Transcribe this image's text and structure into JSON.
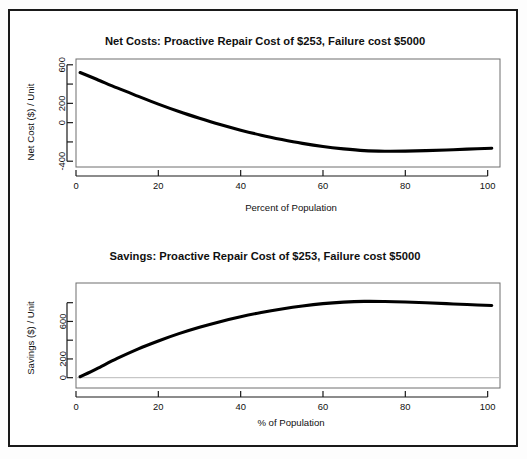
{
  "figure": {
    "background_color": "#ffffff",
    "frame_color": "#1a1a1a",
    "curve_color": "#000000",
    "box_color": "#6e6e6e"
  },
  "chart_data": [
    {
      "type": "line",
      "id": "net-costs",
      "title": "Net Costs: Proactive Repair Cost of $253, Failure cost $5000",
      "xlabel": "Percent of Population",
      "ylabel": "Net Cost ($) / Unit",
      "xlim": [
        0,
        103
      ],
      "ylim": [
        -460,
        660
      ],
      "xticks": [
        0,
        20,
        40,
        60,
        80,
        100
      ],
      "xticklabels": [
        "0",
        "20",
        "40",
        "60",
        "80",
        "100"
      ],
      "yticks": [
        -400,
        -200,
        0,
        200,
        400,
        600
      ],
      "yticklabels": [
        "-400",
        "",
        "0",
        "200",
        "",
        "600"
      ],
      "grid": false,
      "legend": "none",
      "x": [
        1,
        5,
        10,
        15,
        20,
        25,
        30,
        35,
        40,
        45,
        50,
        55,
        60,
        65,
        70,
        75,
        80,
        85,
        90,
        95,
        101
      ],
      "values": [
        520,
        450,
        360,
        275,
        192,
        115,
        45,
        -20,
        -78,
        -130,
        -175,
        -215,
        -248,
        -272,
        -290,
        -296,
        -295,
        -290,
        -283,
        -275,
        -265
      ]
    },
    {
      "type": "line",
      "id": "savings",
      "title": "Savings: Proactive Repair Cost of $253, Failure cost $5000",
      "xlabel": "% of Population",
      "ylabel": "Savings ($) / Unit",
      "xlim": [
        0,
        103
      ],
      "ylim": [
        -110,
        1010
      ],
      "xticks": [
        0,
        20,
        40,
        60,
        80,
        100
      ],
      "xticklabels": [
        "0",
        "20",
        "40",
        "60",
        "80",
        "100"
      ],
      "yticks": [
        0,
        200,
        400,
        600,
        800
      ],
      "yticklabels": [
        "0",
        "200",
        "",
        "600",
        ""
      ],
      "grid": false,
      "legend": "none",
      "zero_reference_line": 0,
      "x": [
        1,
        5,
        10,
        15,
        20,
        25,
        30,
        35,
        40,
        45,
        50,
        55,
        60,
        65,
        70,
        75,
        80,
        85,
        90,
        95,
        101
      ],
      "values": [
        10,
        95,
        205,
        305,
        392,
        470,
        538,
        598,
        650,
        695,
        733,
        765,
        790,
        806,
        814,
        813,
        808,
        800,
        790,
        780,
        770
      ]
    }
  ]
}
